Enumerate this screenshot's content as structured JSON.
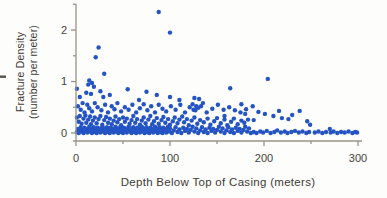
{
  "figure": {
    "title": "",
    "artifact": "page-edge-mark"
  },
  "chart_data": {
    "type": "scatter",
    "title": "",
    "xlabel": "Depth Below Top of Casing (meters)",
    "ylabel": "Fracture Density (number per meter)",
    "ylabel_lines": [
      "Fracture Density",
      "(number per meter)"
    ],
    "xlim": [
      0,
      305
    ],
    "ylim": [
      -0.15,
      2.5
    ],
    "grid": false,
    "legend": null,
    "x_major_ticks": [
      0,
      100,
      200,
      300
    ],
    "x_minor_ticks": [
      50,
      150,
      250
    ],
    "y_major_ticks": [
      0,
      1,
      2
    ],
    "y_minor_ticks": [
      0.5,
      1.5,
      2.5
    ],
    "x_tick_labels": [
      "0",
      "100",
      "200",
      "300"
    ],
    "y_tick_labels": [
      "0",
      "1",
      "2"
    ],
    "point_color": "#2454c4",
    "axis_color": "#98938a",
    "text_color": "#44403a",
    "points": [
      [
        88,
        2.35
      ],
      [
        100,
        1.95
      ],
      [
        24,
        1.66
      ],
      [
        21,
        1.47
      ],
      [
        30,
        1.15
      ],
      [
        204,
        1.05
      ],
      [
        14,
        1.02
      ],
      [
        17,
        0.97
      ],
      [
        13,
        0.94
      ],
      [
        19,
        0.9
      ],
      [
        1,
        0.86
      ],
      [
        55,
        0.85
      ],
      [
        164,
        0.87
      ],
      [
        26,
        0.81
      ],
      [
        75,
        0.8
      ],
      [
        11,
        0.78
      ],
      [
        16,
        0.76
      ],
      [
        36,
        0.74
      ],
      [
        86,
        0.74
      ],
      [
        4,
        0.7
      ],
      [
        29,
        0.7
      ],
      [
        100,
        0.7
      ],
      [
        126,
        0.68
      ],
      [
        131,
        0.66
      ],
      [
        67,
        0.64
      ],
      [
        110,
        0.64
      ],
      [
        135,
        0.58
      ],
      [
        176,
        0.56
      ],
      [
        124,
        0.56
      ],
      [
        128,
        0.52
      ],
      [
        130,
        0.49
      ],
      [
        125,
        0.45
      ],
      [
        2,
        0.52
      ],
      [
        5,
        0.45
      ],
      [
        7,
        0.58
      ],
      [
        9,
        0.4
      ],
      [
        12,
        0.55
      ],
      [
        14,
        0.48
      ],
      [
        17,
        0.42
      ],
      [
        20,
        0.58
      ],
      [
        23,
        0.5
      ],
      [
        27,
        0.44
      ],
      [
        31,
        0.55
      ],
      [
        34,
        0.4
      ],
      [
        38,
        0.52
      ],
      [
        41,
        0.46
      ],
      [
        44,
        0.58
      ],
      [
        48,
        0.42
      ],
      [
        52,
        0.5
      ],
      [
        56,
        0.45
      ],
      [
        60,
        0.55
      ],
      [
        64,
        0.4
      ],
      [
        68,
        0.48
      ],
      [
        72,
        0.56
      ],
      [
        76,
        0.44
      ],
      [
        80,
        0.52
      ],
      [
        84,
        0.4
      ],
      [
        88,
        0.55
      ],
      [
        92,
        0.47
      ],
      [
        96,
        0.42
      ],
      [
        101,
        0.52
      ],
      [
        106,
        0.45
      ],
      [
        111,
        0.55
      ],
      [
        116,
        0.4
      ],
      [
        121,
        0.5
      ],
      [
        127,
        0.44
      ],
      [
        133,
        0.52
      ],
      [
        139,
        0.4
      ],
      [
        145,
        0.47
      ],
      [
        151,
        0.55
      ],
      [
        157,
        0.45
      ],
      [
        163,
        0.5
      ],
      [
        169,
        0.44
      ],
      [
        175,
        0.4
      ],
      [
        181,
        0.46
      ],
      [
        188,
        0.52
      ],
      [
        194,
        0.41
      ],
      [
        201,
        0.37
      ],
      [
        210,
        0.33
      ],
      [
        216,
        0.43
      ],
      [
        219,
        0.29
      ],
      [
        226,
        0.27
      ],
      [
        230,
        0.35
      ],
      [
        238,
        0.43
      ],
      [
        246,
        0.23
      ],
      [
        249,
        0.16
      ],
      [
        189,
        0.25
      ],
      [
        270,
        0.08
      ],
      [
        158,
        0.33
      ],
      [
        180,
        0.37
      ],
      [
        1,
        0.3
      ],
      [
        3,
        0.22
      ],
      [
        4,
        0.33
      ],
      [
        6,
        0.18
      ],
      [
        8,
        0.28
      ],
      [
        10,
        0.34
      ],
      [
        11,
        0.2
      ],
      [
        13,
        0.26
      ],
      [
        15,
        0.32
      ],
      [
        16,
        0.17
      ],
      [
        18,
        0.24
      ],
      [
        20,
        0.3
      ],
      [
        22,
        0.19
      ],
      [
        24,
        0.27
      ],
      [
        26,
        0.33
      ],
      [
        28,
        0.16
      ],
      [
        30,
        0.25
      ],
      [
        32,
        0.31
      ],
      [
        34,
        0.2
      ],
      [
        36,
        0.28
      ],
      [
        38,
        0.17
      ],
      [
        40,
        0.24
      ],
      [
        42,
        0.32
      ],
      [
        44,
        0.21
      ],
      [
        46,
        0.27
      ],
      [
        48,
        0.15
      ],
      [
        50,
        0.3
      ],
      [
        52,
        0.22
      ],
      [
        54,
        0.28
      ],
      [
        57,
        0.18
      ],
      [
        59,
        0.25
      ],
      [
        61,
        0.33
      ],
      [
        63,
        0.2
      ],
      [
        65,
        0.27
      ],
      [
        68,
        0.16
      ],
      [
        70,
        0.24
      ],
      [
        72,
        0.3
      ],
      [
        74,
        0.19
      ],
      [
        77,
        0.26
      ],
      [
        79,
        0.33
      ],
      [
        81,
        0.17
      ],
      [
        83,
        0.23
      ],
      [
        86,
        0.29
      ],
      [
        88,
        0.18
      ],
      [
        91,
        0.25
      ],
      [
        93,
        0.31
      ],
      [
        95,
        0.2
      ],
      [
        98,
        0.27
      ],
      [
        100,
        0.16
      ],
      [
        103,
        0.23
      ],
      [
        105,
        0.3
      ],
      [
        108,
        0.19
      ],
      [
        110,
        0.26
      ],
      [
        113,
        0.32
      ],
      [
        115,
        0.21
      ],
      [
        118,
        0.27
      ],
      [
        120,
        0.15
      ],
      [
        123,
        0.24
      ],
      [
        126,
        0.3
      ],
      [
        129,
        0.18
      ],
      [
        132,
        0.25
      ],
      [
        136,
        0.21
      ],
      [
        140,
        0.28
      ],
      [
        143,
        0.16
      ],
      [
        147,
        0.23
      ],
      [
        150,
        0.29
      ],
      [
        154,
        0.19
      ],
      [
        158,
        0.26
      ],
      [
        161,
        0.15
      ],
      [
        165,
        0.22
      ],
      [
        168,
        0.28
      ],
      [
        172,
        0.17
      ],
      [
        176,
        0.24
      ],
      [
        179,
        0.2
      ],
      [
        183,
        0.26
      ],
      [
        1,
        0.02
      ],
      [
        2,
        0.08
      ],
      [
        3,
        0.0
      ],
      [
        4,
        0.05
      ],
      [
        5,
        0.11
      ],
      [
        6,
        0.03
      ],
      [
        7,
        0.07
      ],
      [
        8,
        0.0
      ],
      [
        9,
        0.1
      ],
      [
        10,
        0.04
      ],
      [
        11,
        0.08
      ],
      [
        12,
        0.01
      ],
      [
        13,
        0.06
      ],
      [
        14,
        0.12
      ],
      [
        15,
        0.03
      ],
      [
        16,
        0.09
      ],
      [
        17,
        0.0
      ],
      [
        18,
        0.05
      ],
      [
        19,
        0.11
      ],
      [
        20,
        0.02
      ],
      [
        21,
        0.07
      ],
      [
        22,
        0.0
      ],
      [
        23,
        0.1
      ],
      [
        24,
        0.04
      ],
      [
        25,
        0.08
      ],
      [
        26,
        0.01
      ],
      [
        27,
        0.06
      ],
      [
        28,
        0.12
      ],
      [
        29,
        0.03
      ],
      [
        30,
        0.09
      ],
      [
        31,
        0.0
      ],
      [
        32,
        0.05
      ],
      [
        33,
        0.11
      ],
      [
        34,
        0.02
      ],
      [
        35,
        0.07
      ],
      [
        36,
        0.0
      ],
      [
        37,
        0.1
      ],
      [
        38,
        0.04
      ],
      [
        39,
        0.08
      ],
      [
        40,
        0.01
      ],
      [
        41,
        0.06
      ],
      [
        42,
        0.12
      ],
      [
        43,
        0.03
      ],
      [
        44,
        0.09
      ],
      [
        45,
        0.0
      ],
      [
        46,
        0.05
      ],
      [
        47,
        0.11
      ],
      [
        48,
        0.02
      ],
      [
        49,
        0.07
      ],
      [
        50,
        0.0
      ],
      [
        51,
        0.1
      ],
      [
        52,
        0.04
      ],
      [
        53,
        0.08
      ],
      [
        54,
        0.01
      ],
      [
        55,
        0.06
      ],
      [
        56,
        0.12
      ],
      [
        57,
        0.03
      ],
      [
        58,
        0.09
      ],
      [
        59,
        0.0
      ],
      [
        60,
        0.05
      ],
      [
        61,
        0.11
      ],
      [
        62,
        0.02
      ],
      [
        63,
        0.07
      ],
      [
        64,
        0.0
      ],
      [
        65,
        0.1
      ],
      [
        66,
        0.04
      ],
      [
        67,
        0.08
      ],
      [
        68,
        0.01
      ],
      [
        69,
        0.06
      ],
      [
        70,
        0.12
      ],
      [
        71,
        0.03
      ],
      [
        72,
        0.09
      ],
      [
        73,
        0.0
      ],
      [
        74,
        0.05
      ],
      [
        75,
        0.11
      ],
      [
        76,
        0.02
      ],
      [
        77,
        0.07
      ],
      [
        78,
        0.0
      ],
      [
        79,
        0.1
      ],
      [
        80,
        0.04
      ],
      [
        81,
        0.08
      ],
      [
        82,
        0.01
      ],
      [
        83,
        0.06
      ],
      [
        84,
        0.12
      ],
      [
        85,
        0.03
      ],
      [
        86,
        0.09
      ],
      [
        87,
        0.0
      ],
      [
        88,
        0.05
      ],
      [
        89,
        0.11
      ],
      [
        90,
        0.02
      ],
      [
        91,
        0.07
      ],
      [
        92,
        0.0
      ],
      [
        93,
        0.1
      ],
      [
        94,
        0.04
      ],
      [
        95,
        0.08
      ],
      [
        96,
        0.01
      ],
      [
        97,
        0.06
      ],
      [
        98,
        0.12
      ],
      [
        99,
        0.03
      ],
      [
        100,
        0.09
      ],
      [
        102,
        0.0
      ],
      [
        104,
        0.05
      ],
      [
        106,
        0.11
      ],
      [
        108,
        0.02
      ],
      [
        110,
        0.07
      ],
      [
        112,
        0.0
      ],
      [
        114,
        0.1
      ],
      [
        116,
        0.04
      ],
      [
        118,
        0.08
      ],
      [
        120,
        0.01
      ],
      [
        122,
        0.06
      ],
      [
        124,
        0.12
      ],
      [
        126,
        0.03
      ],
      [
        128,
        0.09
      ],
      [
        130,
        0.0
      ],
      [
        132,
        0.05
      ],
      [
        134,
        0.11
      ],
      [
        136,
        0.02
      ],
      [
        138,
        0.07
      ],
      [
        140,
        0.0
      ],
      [
        142,
        0.1
      ],
      [
        144,
        0.04
      ],
      [
        146,
        0.08
      ],
      [
        148,
        0.01
      ],
      [
        150,
        0.06
      ],
      [
        152,
        0.12
      ],
      [
        154,
        0.03
      ],
      [
        156,
        0.09
      ],
      [
        158,
        0.0
      ],
      [
        160,
        0.05
      ],
      [
        162,
        0.11
      ],
      [
        164,
        0.02
      ],
      [
        166,
        0.07
      ],
      [
        168,
        0.0
      ],
      [
        170,
        0.1
      ],
      [
        172,
        0.04
      ],
      [
        174,
        0.08
      ],
      [
        176,
        0.01
      ],
      [
        178,
        0.06
      ],
      [
        180,
        0.12
      ],
      [
        182,
        0.03
      ],
      [
        184,
        0.09
      ],
      [
        186,
        0.0
      ],
      [
        189,
        0.02
      ],
      [
        192,
        0.0
      ],
      [
        196,
        0.03
      ],
      [
        199,
        0.01
      ],
      [
        203,
        0.04
      ],
      [
        207,
        0.0
      ],
      [
        211,
        0.02
      ],
      [
        214,
        0.05
      ],
      [
        218,
        0.01
      ],
      [
        222,
        0.03
      ],
      [
        225,
        0.0
      ],
      [
        229,
        0.02
      ],
      [
        233,
        0.04
      ],
      [
        237,
        0.01
      ],
      [
        241,
        0.03
      ],
      [
        245,
        0.0
      ],
      [
        248,
        0.02
      ],
      [
        254,
        0.01
      ],
      [
        258,
        0.03
      ],
      [
        262,
        0.0
      ],
      [
        266,
        0.02
      ],
      [
        271,
        0.01
      ],
      [
        274,
        0.03
      ],
      [
        278,
        0.0
      ],
      [
        282,
        0.02
      ],
      [
        286,
        0.01
      ],
      [
        290,
        0.03
      ],
      [
        294,
        0.0
      ],
      [
        297,
        0.02
      ],
      [
        299,
        0.01
      ]
    ]
  }
}
